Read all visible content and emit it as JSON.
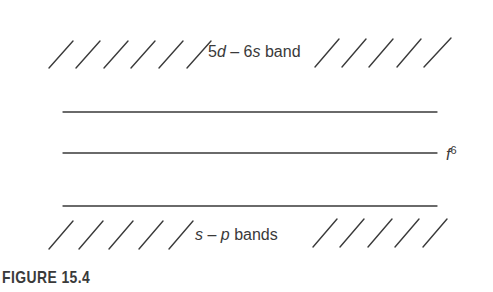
{
  "figure": {
    "caption": "FIGURE 15.4",
    "labels": {
      "upper_band": {
        "a": "5",
        "b": "d",
        "c": " – 6",
        "d": "s",
        "e": " band"
      },
      "level": {
        "base": "f",
        "sup": "6"
      },
      "lower_band": {
        "a": "s",
        "b": " – ",
        "c": "p",
        "d": " bands"
      }
    },
    "levels": [
      {
        "name": "upper-line",
        "y": 112
      },
      {
        "name": "f6-line",
        "y": 153
      },
      {
        "name": "lower-line",
        "y": 206
      }
    ],
    "colors": {
      "ink": "#3a3a3a",
      "background": "#ffffff"
    }
  }
}
